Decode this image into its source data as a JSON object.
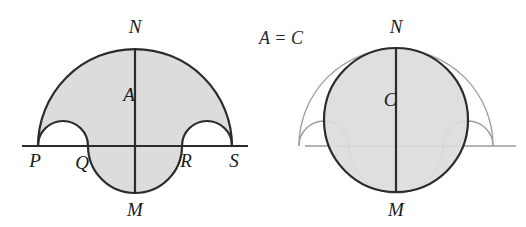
{
  "figure": {
    "caption_relation": "A = C",
    "equals_sign": "=",
    "background_color": "#ffffff",
    "fill_color": "#dcdcdc",
    "stroke_dark": "#2b2b2b",
    "stroke_light": "#9a9a9a"
  },
  "left_diagram": {
    "name": "salinon-region-A",
    "region_label": "A",
    "labels": {
      "top": "N",
      "bottom": "M",
      "baseline_left_end": "P",
      "baseline_inner_left": "Q",
      "baseline_inner_right": "R",
      "baseline_right_end": "S"
    },
    "points": {
      "P": [
        38,
        146
      ],
      "Q": [
        88,
        146
      ],
      "R": [
        182,
        146
      ],
      "S": [
        232,
        146
      ],
      "N": [
        135,
        48
      ],
      "M": [
        135,
        192
      ]
    },
    "arcs": [
      {
        "name": "large-upper-semicircle",
        "from": "P",
        "to": "S",
        "direction": "up",
        "radius": 97
      },
      {
        "name": "small-upper-semicircle-left",
        "from": "P",
        "to": "Q",
        "direction": "up",
        "radius": 25
      },
      {
        "name": "small-upper-semicircle-right",
        "from": "R",
        "to": "S",
        "direction": "up",
        "radius": 25
      },
      {
        "name": "lower-semicircle",
        "from": "Q",
        "to": "R",
        "direction": "down",
        "radius": 47
      }
    ]
  },
  "right_diagram": {
    "name": "equivalent-circle-C",
    "region_label": "C",
    "labels": {
      "top": "N",
      "bottom": "M"
    },
    "circle": {
      "center": [
        396,
        120
      ],
      "radius": 72,
      "diameter_endpoints": [
        "N",
        "M"
      ]
    },
    "points": {
      "N": [
        396,
        48
      ],
      "M": [
        396,
        192
      ]
    },
    "ghost_outline": "faint salinon outline behind circle"
  },
  "ghost_text": {
    "line1": "",
    "line2": ""
  }
}
